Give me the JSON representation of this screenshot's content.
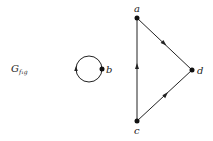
{
  "diagram": {
    "title": {
      "main": "G",
      "subscript": "f₁g"
    },
    "nodes": [
      {
        "id": "a",
        "label": "a",
        "x": 137,
        "y": 18,
        "lx": 134,
        "ly": 11
      },
      {
        "id": "b",
        "label": "b",
        "x": 102,
        "y": 69,
        "lx": 107,
        "ly": 72
      },
      {
        "id": "c",
        "label": "c",
        "x": 137,
        "y": 121,
        "lx": 134,
        "ly": 134
      },
      {
        "id": "d",
        "label": "d",
        "x": 192,
        "y": 70,
        "lx": 197,
        "ly": 73
      }
    ],
    "edges": [
      {
        "from": "a",
        "to": "d"
      },
      {
        "from": "c",
        "to": "d"
      },
      {
        "from": "c",
        "to": "a"
      },
      {
        "from": "b",
        "to": "b",
        "type": "loop"
      }
    ],
    "colors": {
      "stroke": "#222222",
      "background": "#ffffff"
    }
  }
}
